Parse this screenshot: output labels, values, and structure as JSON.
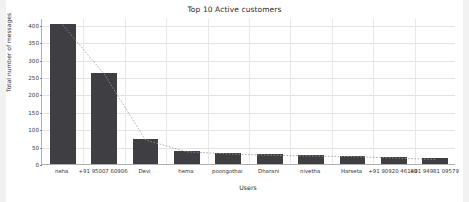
{
  "chart_data": {
    "type": "bar",
    "title": "Top 10 Active customers",
    "xlabel": "Users",
    "ylabel": "Total number of messages",
    "categories": [
      "neha",
      "+91 95007 60906",
      "Devi",
      "hema",
      "poongothai",
      "Dharani",
      "nivetha",
      "Harseta",
      "+91 90920 46180",
      "+91 94981 09579"
    ],
    "values": [
      403,
      262,
      72,
      38,
      32,
      28,
      26,
      24,
      20,
      16
    ],
    "ylim": [
      0,
      420
    ],
    "yticks": [
      0,
      50,
      100,
      150,
      200,
      250,
      300,
      350,
      400
    ],
    "ytick_labels": [
      "0",
      "50",
      "100",
      "150",
      "200",
      "250",
      "300",
      "350",
      "400"
    ],
    "grid": true,
    "legend": null,
    "bar_color": "#3f3f43",
    "trend_overlay": {
      "type": "line",
      "style": "dotted",
      "color": "#9a9a9a",
      "values": [
        403,
        262,
        72,
        38,
        32,
        28,
        26,
        24,
        20,
        16
      ]
    }
  },
  "figure": {
    "background_color": "#ffffff",
    "axes_color": "#b0b0b0",
    "grid_color": "#e3e3e3"
  }
}
